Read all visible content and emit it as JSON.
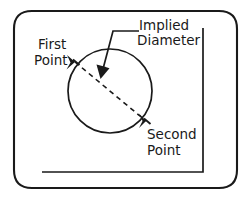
{
  "figure": {
    "title_text": "",
    "background_color": "#ffffff",
    "line_color": "#1a1a1a"
  },
  "labels": {
    "first_point_line1": "First",
    "first_point_line2": "Point",
    "implied_diameter_line1": "Implied",
    "implied_diameter_line2": "Diameter",
    "second_point_line1": "Second",
    "second_point_line2": "Point"
  },
  "geometry": {
    "circle": {
      "cx": 110,
      "cy": 91,
      "r": 42
    },
    "first_point": {
      "x": 75,
      "y": 62
    },
    "second_point": {
      "x": 146,
      "y": 121
    },
    "diameter_line_style": "dashed",
    "leader_arrow_tip": {
      "x": 101,
      "y": 77
    }
  },
  "frame": {
    "bezel_shape": "rounded-rectangle",
    "inner_frame_shape": "L-shaped corner line"
  }
}
